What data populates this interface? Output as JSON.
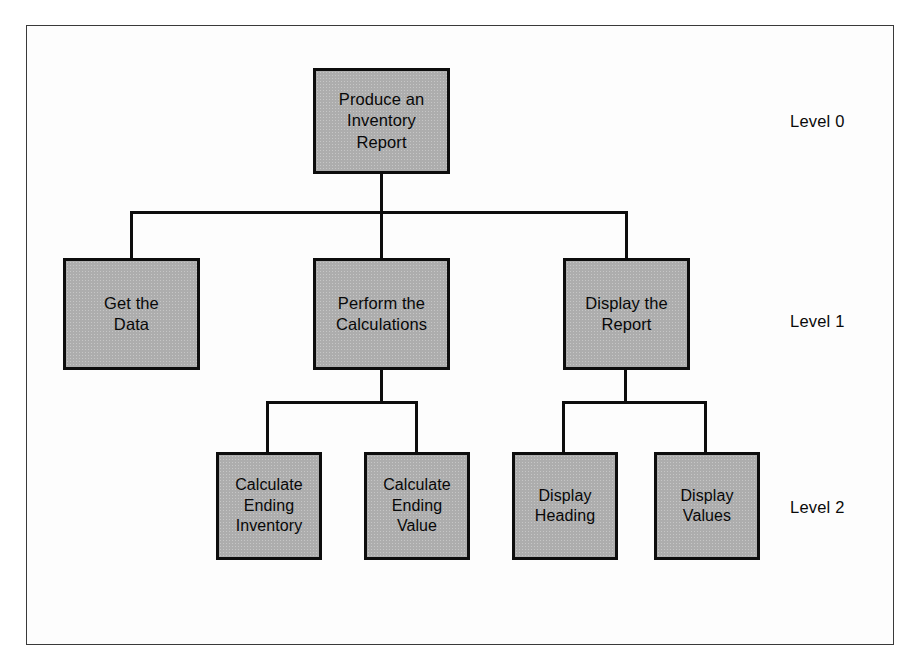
{
  "diagram": {
    "type": "structure-chart",
    "frame": {
      "border_color": "#3a3a3a"
    },
    "style": {
      "box_fill": "#adadad",
      "box_border": "#0d0d0d",
      "line_color": "#0d0d0d",
      "text_color": "#080808",
      "background": "#ffffff"
    },
    "levels": [
      {
        "id": "level0",
        "label": "Level 0",
        "label_x": 790,
        "label_y": 112
      },
      {
        "id": "level1",
        "label": "Level 1",
        "label_x": 790,
        "label_y": 312
      },
      {
        "id": "level2",
        "label": "Level 2",
        "label_x": 790,
        "label_y": 498
      }
    ],
    "nodes": [
      {
        "id": "produce-inventory-report",
        "level": 0,
        "text": "Produce an\nInventory\nReport",
        "x": 313,
        "y": 68,
        "w": 137,
        "h": 106
      },
      {
        "id": "get-the-data",
        "level": 1,
        "text": "Get the\nData",
        "x": 63,
        "y": 258,
        "w": 137,
        "h": 112
      },
      {
        "id": "perform-the-calculations",
        "level": 1,
        "text": "Perform the\nCalculations",
        "x": 313,
        "y": 258,
        "w": 137,
        "h": 112
      },
      {
        "id": "display-the-report",
        "level": 1,
        "text": "Display the\nReport",
        "x": 563,
        "y": 258,
        "w": 127,
        "h": 112
      },
      {
        "id": "calculate-ending-inventory",
        "level": 2,
        "text": "Calculate\nEnding\nInventory",
        "x": 216,
        "y": 452,
        "w": 106,
        "h": 108
      },
      {
        "id": "calculate-ending-value",
        "level": 2,
        "text": "Calculate\nEnding\nValue",
        "x": 364,
        "y": 452,
        "w": 106,
        "h": 108
      },
      {
        "id": "display-heading",
        "level": 2,
        "text": "Display\nHeading",
        "x": 512,
        "y": 452,
        "w": 106,
        "h": 108
      },
      {
        "id": "display-values",
        "level": 2,
        "text": "Display\nValues",
        "x": 654,
        "y": 452,
        "w": 106,
        "h": 108
      }
    ],
    "edges": [
      {
        "from": "produce-inventory-report",
        "to": "get-the-data"
      },
      {
        "from": "produce-inventory-report",
        "to": "perform-the-calculations"
      },
      {
        "from": "produce-inventory-report",
        "to": "display-the-report"
      },
      {
        "from": "perform-the-calculations",
        "to": "calculate-ending-inventory"
      },
      {
        "from": "perform-the-calculations",
        "to": "calculate-ending-value"
      },
      {
        "from": "display-the-report",
        "to": "display-heading"
      },
      {
        "from": "display-the-report",
        "to": "display-values"
      }
    ],
    "connectors": [
      {
        "id": "root-stem",
        "kind": "v",
        "x": 380,
        "y": 174,
        "len": 39
      },
      {
        "id": "level1-bus",
        "kind": "h",
        "x": 130,
        "y": 211,
        "len": 498
      },
      {
        "id": "drop-get-data",
        "kind": "v",
        "x": 130,
        "y": 211,
        "len": 49
      },
      {
        "id": "drop-perform",
        "kind": "v",
        "x": 380,
        "y": 211,
        "len": 49
      },
      {
        "id": "drop-display",
        "kind": "v",
        "x": 625,
        "y": 211,
        "len": 49
      },
      {
        "id": "perform-stem",
        "kind": "v",
        "x": 380,
        "y": 370,
        "len": 33
      },
      {
        "id": "level2-bus-left",
        "kind": "h",
        "x": 266,
        "y": 401,
        "len": 152
      },
      {
        "id": "drop-calc-inv",
        "kind": "v",
        "x": 266,
        "y": 401,
        "len": 53
      },
      {
        "id": "drop-calc-val",
        "kind": "v",
        "x": 415,
        "y": 401,
        "len": 53
      },
      {
        "id": "display-stem",
        "kind": "v",
        "x": 624,
        "y": 370,
        "len": 33
      },
      {
        "id": "level2-bus-right",
        "kind": "h",
        "x": 562,
        "y": 401,
        "len": 145
      },
      {
        "id": "drop-disp-head",
        "kind": "v",
        "x": 562,
        "y": 401,
        "len": 53
      },
      {
        "id": "drop-disp-val",
        "kind": "v",
        "x": 704,
        "y": 401,
        "len": 53
      }
    ]
  }
}
